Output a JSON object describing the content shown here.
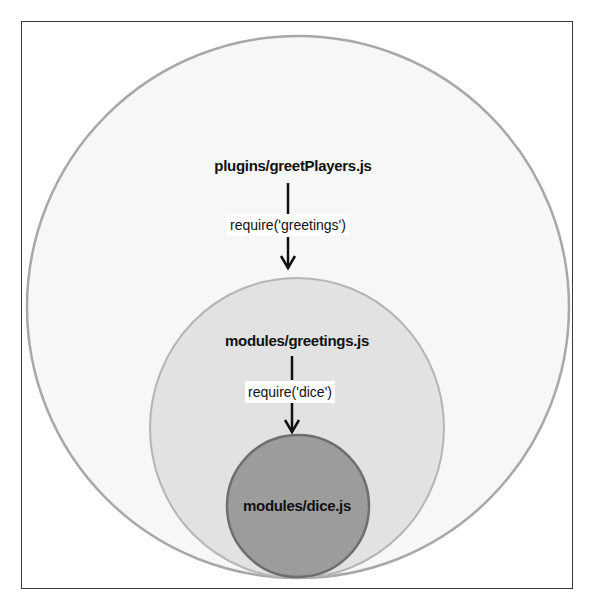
{
  "diagram": {
    "type": "nested-module-dependency",
    "colors": {
      "frame": "#3a3a3a",
      "outer_fill": "#f7f7f7",
      "outer_stroke": "#a8a8a8",
      "middle_fill": "#e2e2e2",
      "middle_stroke": "#b5b5b5",
      "inner_fill": "#9c9c9c",
      "inner_stroke": "#6e6e6e",
      "arrow": "#111111"
    },
    "nodes": [
      {
        "id": "greetPlayers",
        "label": "plugins/greetPlayers.js"
      },
      {
        "id": "greetings",
        "label": "modules/greetings.js"
      },
      {
        "id": "dice",
        "label": "modules/dice.js"
      }
    ],
    "edges": [
      {
        "from": "greetPlayers",
        "to": "greetings",
        "label": "require('greetings')"
      },
      {
        "from": "greetings",
        "to": "dice",
        "label": "require('dice')"
      }
    ]
  }
}
